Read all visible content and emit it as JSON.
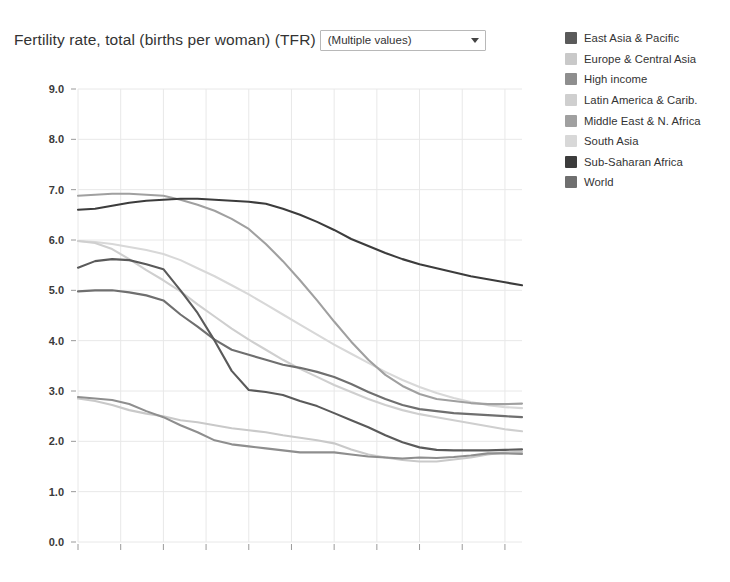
{
  "header": {
    "title": "Fertility rate, total (births per woman) (TFR)",
    "filter": {
      "value": "(Multiple values)",
      "caret_icon": "chevron-down-icon"
    }
  },
  "chart_data": {
    "type": "line",
    "title": "Fertility rate, total (births per woman) (TFR)",
    "xlabel": "",
    "ylabel": "",
    "xlim": [
      1960,
      2012
    ],
    "ylim": [
      0.0,
      9.0
    ],
    "grid": true,
    "legend_position": "right",
    "ytick_labels": [
      "9.0",
      "8.0",
      "7.0",
      "6.0",
      "5.0",
      "4.0",
      "3.0",
      "2.0",
      "1.0",
      "0.0"
    ],
    "yticks": [
      9.0,
      8.0,
      7.0,
      6.0,
      5.0,
      4.0,
      3.0,
      2.0,
      1.0,
      0.0
    ],
    "xtick_labels": [
      "1960",
      "1965",
      "1970",
      "1975",
      "1980",
      "1985",
      "1990",
      "1995",
      "2000",
      "2005",
      "2010"
    ],
    "xticks": [
      1960,
      1965,
      1970,
      1975,
      1980,
      1985,
      1990,
      1995,
      2000,
      2005,
      2010
    ],
    "x": [
      1960,
      1962,
      1964,
      1966,
      1968,
      1970,
      1972,
      1974,
      1976,
      1978,
      1980,
      1982,
      1984,
      1986,
      1988,
      1990,
      1992,
      1994,
      1996,
      1998,
      2000,
      2002,
      2004,
      2006,
      2008,
      2010,
      2012
    ],
    "series": [
      {
        "name": "East Asia & Pacific",
        "color": "#5a5a5a",
        "values": [
          5.45,
          5.58,
          5.62,
          5.6,
          5.52,
          5.42,
          5.0,
          4.55,
          4.0,
          3.4,
          3.02,
          2.98,
          2.92,
          2.8,
          2.7,
          2.56,
          2.42,
          2.28,
          2.12,
          1.98,
          1.88,
          1.83,
          1.82,
          1.82,
          1.82,
          1.83,
          1.84
        ]
      },
      {
        "name": "Europe & Central Asia",
        "color": "#c9c9c9",
        "values": [
          2.85,
          2.8,
          2.72,
          2.62,
          2.55,
          2.5,
          2.42,
          2.38,
          2.32,
          2.26,
          2.22,
          2.18,
          2.12,
          2.07,
          2.02,
          1.96,
          1.84,
          1.74,
          1.68,
          1.63,
          1.6,
          1.6,
          1.64,
          1.68,
          1.74,
          1.78,
          1.79
        ]
      },
      {
        "name": "High income",
        "color": "#8e8e8e",
        "values": [
          2.88,
          2.85,
          2.82,
          2.74,
          2.6,
          2.48,
          2.32,
          2.18,
          2.02,
          1.94,
          1.9,
          1.86,
          1.82,
          1.78,
          1.78,
          1.78,
          1.74,
          1.7,
          1.68,
          1.66,
          1.68,
          1.67,
          1.69,
          1.72,
          1.76,
          1.76,
          1.75
        ]
      },
      {
        "name": "Latin America & Carib.",
        "color": "#cfcfcf",
        "values": [
          5.98,
          5.94,
          5.82,
          5.62,
          5.4,
          5.2,
          4.98,
          4.72,
          4.48,
          4.24,
          4.02,
          3.82,
          3.62,
          3.44,
          3.28,
          3.12,
          2.98,
          2.84,
          2.72,
          2.62,
          2.54,
          2.48,
          2.42,
          2.36,
          2.3,
          2.24,
          2.2
        ]
      },
      {
        "name": "Middle East & N. Africa",
        "color": "#a0a0a0",
        "values": [
          6.88,
          6.9,
          6.92,
          6.92,
          6.9,
          6.88,
          6.8,
          6.7,
          6.58,
          6.42,
          6.22,
          5.92,
          5.58,
          5.2,
          4.8,
          4.38,
          3.98,
          3.62,
          3.32,
          3.1,
          2.94,
          2.84,
          2.8,
          2.76,
          2.74,
          2.74,
          2.75
        ]
      },
      {
        "name": "South Asia",
        "color": "#d8d8d8",
        "values": [
          5.98,
          5.96,
          5.92,
          5.86,
          5.8,
          5.72,
          5.6,
          5.44,
          5.28,
          5.1,
          4.92,
          4.72,
          4.52,
          4.32,
          4.12,
          3.92,
          3.74,
          3.56,
          3.38,
          3.22,
          3.08,
          2.96,
          2.86,
          2.78,
          2.72,
          2.68,
          2.66
        ]
      },
      {
        "name": "Sub-Saharan Africa",
        "color": "#3c3c3c",
        "values": [
          6.6,
          6.62,
          6.68,
          6.74,
          6.78,
          6.8,
          6.82,
          6.82,
          6.8,
          6.78,
          6.76,
          6.72,
          6.62,
          6.5,
          6.36,
          6.2,
          6.02,
          5.88,
          5.74,
          5.62,
          5.52,
          5.44,
          5.36,
          5.28,
          5.22,
          5.16,
          5.1
        ]
      },
      {
        "name": "World",
        "color": "#6f6f6f",
        "values": [
          4.98,
          5.0,
          5.0,
          4.96,
          4.9,
          4.8,
          4.52,
          4.28,
          4.02,
          3.82,
          3.72,
          3.62,
          3.52,
          3.46,
          3.38,
          3.28,
          3.14,
          2.98,
          2.84,
          2.72,
          2.64,
          2.6,
          2.56,
          2.54,
          2.52,
          2.5,
          2.48
        ]
      }
    ]
  },
  "legend": {
    "items": [
      {
        "label": "East Asia & Pacific",
        "color": "#5a5a5a"
      },
      {
        "label": "Europe & Central Asia",
        "color": "#c9c9c9"
      },
      {
        "label": "High income",
        "color": "#8e8e8e"
      },
      {
        "label": "Latin America & Carib.",
        "color": "#cfcfcf"
      },
      {
        "label": "Middle East & N. Africa",
        "color": "#a0a0a0"
      },
      {
        "label": "South Asia",
        "color": "#d8d8d8"
      },
      {
        "label": "Sub-Saharan Africa",
        "color": "#3c3c3c"
      },
      {
        "label": "World",
        "color": "#6f6f6f"
      }
    ]
  }
}
